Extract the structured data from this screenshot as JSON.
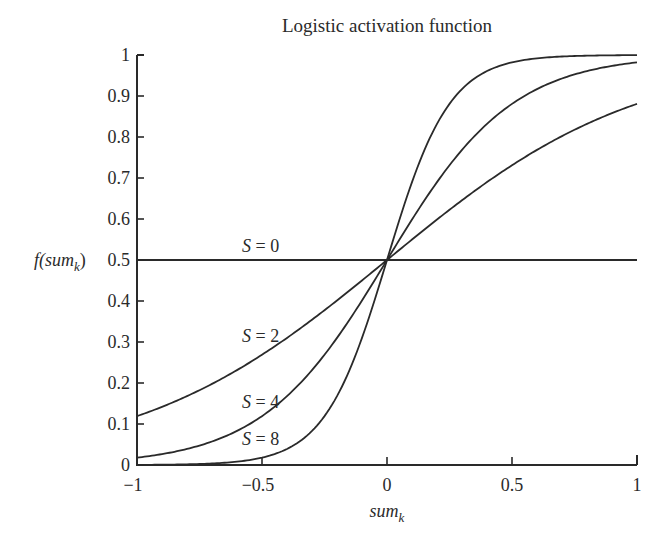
{
  "chart_data": {
    "type": "line",
    "title": "Logistic activation function",
    "xlabel": "sum_k",
    "xlabel_main": "sum",
    "xlabel_sub": "k",
    "ylabel": "f(sum_k)",
    "ylabel_prefix": "f(sum",
    "ylabel_sub": "k",
    "ylabel_suffix": ")",
    "xlim": [
      -1,
      1
    ],
    "ylim": [
      0,
      1
    ],
    "grid": false,
    "legend": "inline labels",
    "formula": "f(x) = 1 / (1 + exp(-S * x))",
    "xticks": [
      -1,
      -0.5,
      0,
      0.5,
      1
    ],
    "xtick_labels": [
      "−1",
      "−0.5",
      "0",
      "0.5",
      "1"
    ],
    "yticks": [
      0,
      0.1,
      0.2,
      0.3,
      0.4,
      0.5,
      0.6,
      0.7,
      0.8,
      0.9,
      1
    ],
    "ytick_labels": [
      "0",
      "0.1",
      "0.2",
      "0.3",
      "0.4",
      "0.5",
      "0.6",
      "0.7",
      "0.8",
      "0.9",
      "1"
    ],
    "series": [
      {
        "name": "S = 0",
        "S": 0,
        "label": "S = 0",
        "label_pos": [
          -0.58,
          0.52
        ],
        "x": [
          -1,
          -0.5,
          0,
          0.5,
          1
        ],
        "values": [
          0.5,
          0.5,
          0.5,
          0.5,
          0.5
        ]
      },
      {
        "name": "S = 2",
        "S": 2,
        "label": "S = 2",
        "label_pos": [
          -0.58,
          0.3
        ],
        "x": [
          -1,
          -0.5,
          0,
          0.5,
          1
        ],
        "values": [
          0.12,
          0.27,
          0.5,
          0.73,
          0.88
        ]
      },
      {
        "name": "S = 4",
        "S": 4,
        "label": "S = 4",
        "label_pos": [
          -0.58,
          0.14
        ],
        "x": [
          -1,
          -0.5,
          0,
          0.5,
          1
        ],
        "values": [
          0.02,
          0.12,
          0.5,
          0.88,
          0.98
        ]
      },
      {
        "name": "S = 8",
        "S": 8,
        "label": "S = 8",
        "label_pos": [
          -0.58,
          0.05
        ],
        "x": [
          -1,
          -0.5,
          0,
          0.5,
          1
        ],
        "values": [
          0.0,
          0.02,
          0.5,
          0.98,
          1.0
        ]
      }
    ]
  }
}
